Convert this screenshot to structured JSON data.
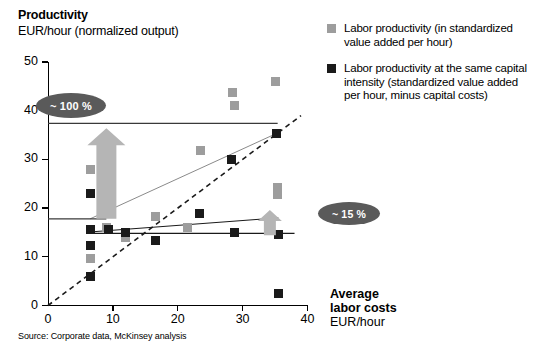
{
  "titles": {
    "y_axis_main": "Productivity",
    "y_axis_sub": "EUR/hour (normalized output)",
    "x_axis_main_line1": "Average",
    "x_axis_main_line2": "labor costs",
    "x_axis_sub": "EUR/hour",
    "source": "Source:  Corporate data, McKinsey analysis"
  },
  "legend": {
    "items": [
      {
        "color": "#9d9d9d",
        "swatch": "light",
        "label": "Labor productivity (in standardized value added per hour)"
      },
      {
        "color": "#1a1a1a",
        "swatch": "dark",
        "label": "Labor productivity at the same capital intensity (standardized value added per hour, minus capital costs)"
      }
    ]
  },
  "callouts": [
    {
      "name": "productivity-gap-100",
      "label": "~ 100 %",
      "color": "#5a5a5a"
    },
    {
      "name": "productivity-gap-15",
      "label": "~ 15 %",
      "color": "#5a5a5a"
    }
  ],
  "chart_data": {
    "type": "scatter",
    "title": "Productivity",
    "subtitle": "EUR/hour (normalized output)",
    "xlabel": "Average labor costs EUR/hour",
    "ylabel": "Productivity EUR/hour (normalized output)",
    "xlim": [
      0,
      40
    ],
    "ylim": [
      0,
      50
    ],
    "xticks": [
      0,
      10,
      20,
      30,
      40
    ],
    "yticks": [
      0,
      10,
      20,
      30,
      40,
      50
    ],
    "grid": false,
    "legend_position": "right",
    "series": [
      {
        "name": "Labor productivity (in standardized value added per hour)",
        "color": "#9d9d9d",
        "marker": "square",
        "points": [
          [
            6.6,
            28.0
          ],
          [
            6.6,
            9.6
          ],
          [
            8.8,
            25.4
          ],
          [
            9.0,
            16.0
          ],
          [
            9.3,
            20.6
          ],
          [
            12.0,
            14.0
          ],
          [
            16.5,
            18.3
          ],
          [
            21.5,
            16.1
          ],
          [
            23.5,
            31.8
          ],
          [
            28.5,
            43.7
          ],
          [
            28.8,
            41.0
          ],
          [
            35.0,
            46.0
          ],
          [
            35.4,
            24.3
          ],
          [
            35.4,
            22.8
          ]
        ]
      },
      {
        "name": "Labor productivity at the same capital intensity (standardized value added per hour, minus capital costs)",
        "color": "#1a1a1a",
        "marker": "square",
        "points": [
          [
            6.6,
            23.0
          ],
          [
            6.6,
            15.6
          ],
          [
            6.6,
            12.4
          ],
          [
            6.6,
            5.9
          ],
          [
            9.3,
            20.4
          ],
          [
            9.3,
            15.7
          ],
          [
            12.0,
            15.0
          ],
          [
            16.6,
            13.4
          ],
          [
            23.3,
            18.9
          ],
          [
            28.3,
            30.0
          ],
          [
            28.8,
            15.0
          ],
          [
            35.2,
            35.3
          ],
          [
            35.5,
            14.6
          ],
          [
            35.5,
            2.5
          ]
        ]
      }
    ],
    "reference_lines": [
      {
        "name": "parity-line",
        "style": "dashed",
        "color": "#1a1a1a",
        "from": [
          0,
          0
        ],
        "to": [
          39.0,
          39.0
        ]
      },
      {
        "name": "upper-trend-light",
        "style": "solid-thin",
        "color": "#8a8a8a",
        "from": [
          6.5,
          17.8
        ],
        "to": [
          35.5,
          35.5
        ]
      },
      {
        "name": "lower-trend-dark",
        "style": "solid-thin",
        "color": "#1a1a1a",
        "from": [
          6.5,
          15.1
        ],
        "to": [
          35.5,
          18.0
        ]
      },
      {
        "name": "top-horizontal-reference",
        "style": "solid",
        "color": "#3a3a3a",
        "from": [
          0,
          37.4
        ],
        "to": [
          35.4,
          37.4
        ]
      },
      {
        "name": "mid-horizontal-reference",
        "style": "solid",
        "color": "#3a3a3a",
        "from": [
          0,
          17.8
        ],
        "to": [
          9.0,
          17.8
        ]
      },
      {
        "name": "bottom-horizontal-reference",
        "style": "solid",
        "color": "#1a1a1a",
        "from": [
          6.5,
          14.8
        ],
        "to": [
          38.0,
          14.8
        ]
      }
    ],
    "gap_arrows": [
      {
        "name": "gap-arrow-100",
        "x": 9.0,
        "y_from": 17.8,
        "y_to": 36.4,
        "label": "~ 100 %",
        "color": "#b5b5b5"
      },
      {
        "name": "gap-arrow-15",
        "x": 34.2,
        "y_from": 14.4,
        "y_to": 19.6,
        "label": "~ 15 %",
        "color": "#b5b5b5"
      }
    ]
  }
}
